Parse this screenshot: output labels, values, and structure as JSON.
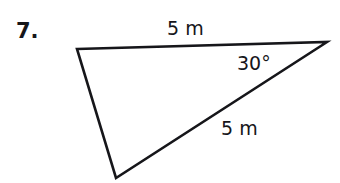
{
  "figure": {
    "problem_number": "7.",
    "background_color": "#ffffff",
    "stroke_color": "#16161a",
    "text_color": "#16161a",
    "stroke_width": 2.6,
    "shape": "triangle",
    "vertices": {
      "top_left": {
        "x": 77,
        "y": 49
      },
      "right": {
        "x": 327,
        "y": 42
      },
      "bottom": {
        "x": 116,
        "y": 178
      }
    },
    "labels": {
      "top_side": "5 m",
      "angle": "30°",
      "diagonal_side": "5 m"
    },
    "label_positions": {
      "top_side": {
        "x": 167,
        "y": 19
      },
      "angle": {
        "x": 237,
        "y": 54
      },
      "diagonal_side": {
        "x": 221,
        "y": 119
      },
      "problem_number": {
        "x": 16,
        "y": 21
      }
    }
  }
}
